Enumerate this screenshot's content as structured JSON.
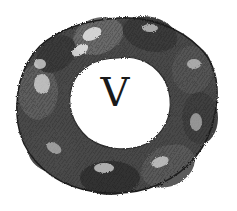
{
  "emblem": {
    "description": "Engraved ring of clasped hands",
    "center_letter": "V",
    "colors": {
      "background": "#ffffff",
      "ink_dark": "#1e1e1e",
      "ink_mid": "#5a5a5a",
      "ink_light": "#b8b8b8",
      "highlight": "#eeeeee"
    },
    "hands_count": 8
  }
}
